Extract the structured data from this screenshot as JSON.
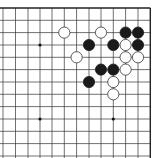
{
  "board": {
    "title": "Go board diagram",
    "grid": {
      "x_lines": [
        3,
        15.5,
        28,
        40,
        52,
        64.3,
        76.6,
        89,
        101,
        113.3,
        125.6,
        138,
        150.3
      ],
      "y_lines": [
        8,
        20.3,
        32.6,
        45,
        57.3,
        69.6,
        82,
        94.3,
        106.6,
        119,
        131.3,
        143.6,
        156
      ],
      "top_edge": true,
      "right_edge": true,
      "line_color": "#333333",
      "edge_color": "#222222"
    },
    "star_points": [
      {
        "col": 3,
        "row": 3
      },
      {
        "col": 3,
        "row": 9
      },
      {
        "col": 9,
        "row": 9
      }
    ],
    "stones": [
      {
        "color": "white",
        "col": 5,
        "row": 2
      },
      {
        "color": "white",
        "col": 8,
        "row": 2
      },
      {
        "color": "black",
        "col": 10,
        "row": 2
      },
      {
        "color": "black",
        "col": 11,
        "row": 2
      },
      {
        "color": "black",
        "col": 7,
        "row": 3
      },
      {
        "color": "black",
        "col": 9,
        "row": 3
      },
      {
        "color": "white",
        "col": 10,
        "row": 3
      },
      {
        "color": "black",
        "col": 11,
        "row": 3
      },
      {
        "color": "white",
        "col": 6,
        "row": 4
      },
      {
        "color": "white",
        "col": 10,
        "row": 4
      },
      {
        "color": "white",
        "col": 11,
        "row": 4
      },
      {
        "color": "black",
        "col": 8,
        "row": 5
      },
      {
        "color": "black",
        "col": 9,
        "row": 5
      },
      {
        "color": "white",
        "col": 10,
        "row": 5
      },
      {
        "color": "black",
        "col": 7,
        "row": 6
      },
      {
        "color": "white",
        "col": 9,
        "row": 6
      },
      {
        "color": "white",
        "col": 9,
        "row": 7
      }
    ],
    "stone_radius": 5.6,
    "colors": {
      "black": "#1a1a1a",
      "white": "#ffffff",
      "white_stroke": "#333333"
    }
  }
}
